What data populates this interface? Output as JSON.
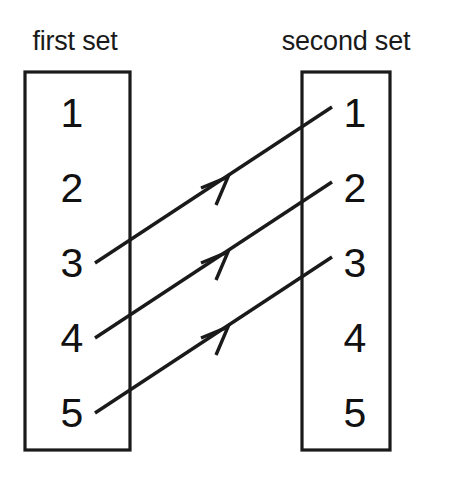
{
  "diagram": {
    "background_color": "#ffffff",
    "ink_color": "#1a1a1a",
    "width": 450,
    "height": 481
  },
  "first_set": {
    "label": "first set",
    "label_x": 75,
    "label_y": 50,
    "box": {
      "x": 25,
      "y": 72,
      "width": 105,
      "height": 378
    },
    "element_x": 72,
    "elements": [
      {
        "value": "1",
        "y": 127
      },
      {
        "value": "2",
        "y": 202
      },
      {
        "value": "3",
        "y": 277
      },
      {
        "value": "4",
        "y": 352
      },
      {
        "value": "5",
        "y": 427
      }
    ]
  },
  "second_set": {
    "label": "second set",
    "label_x": 346,
    "label_y": 50,
    "box": {
      "x": 302,
      "y": 72,
      "width": 88,
      "height": 378
    },
    "element_x": 355,
    "elements": [
      {
        "value": "1",
        "y": 127
      },
      {
        "value": "2",
        "y": 202
      },
      {
        "value": "3",
        "y": 277
      },
      {
        "value": "4",
        "y": 352
      },
      {
        "value": "5",
        "y": 427
      }
    ]
  },
  "mappings": [
    {
      "name": "mapping-3-to-1",
      "from": "3",
      "to": "1",
      "x1": 95,
      "y1": 263,
      "x2": 332,
      "y2": 107,
      "arrow_x": 226,
      "arrow_y": 177
    },
    {
      "name": "mapping-4-to-2",
      "from": "4",
      "to": "2",
      "x1": 95,
      "y1": 338,
      "x2": 332,
      "y2": 182,
      "arrow_x": 226,
      "arrow_y": 252
    },
    {
      "name": "mapping-5-to-3",
      "from": "5",
      "to": "3",
      "x1": 95,
      "y1": 413,
      "x2": 332,
      "y2": 257,
      "arrow_x": 226,
      "arrow_y": 327
    }
  ]
}
